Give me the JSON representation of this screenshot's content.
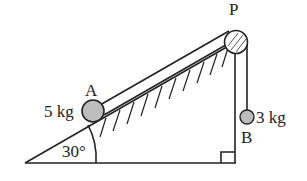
{
  "diagram": {
    "incline_angle_label": "30°",
    "pulley_label": "P",
    "block_a": {
      "label": "A",
      "mass_label": "5 kg"
    },
    "block_b": {
      "label": "B",
      "mass_label": "3 kg"
    },
    "right_angle_marker": true,
    "colors": {
      "line": "#222222",
      "mass_fill": "#bdbdbd",
      "background": "#ffffff"
    }
  }
}
